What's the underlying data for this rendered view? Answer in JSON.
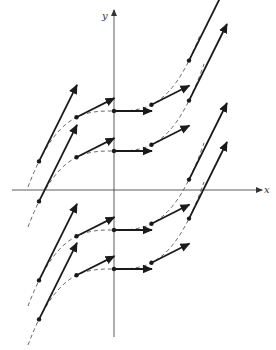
{
  "figure": {
    "type": "slope-field-diagram",
    "axes": {
      "x_label": "x",
      "y_label": "y",
      "origin_px": [
        114,
        190
      ],
      "x_axis_px": {
        "from": 12,
        "to": 262,
        "y": 190
      },
      "y_axis_px": {
        "x": 114,
        "from": 337,
        "to": 10
      }
    },
    "colors": {
      "ink": "#1a1a1a",
      "axis": "#333333",
      "dashed_curve": "#444444",
      "background": "#ffffff"
    },
    "scale": {
      "px_per_unit_x": 37.5
    },
    "rows_y_px": [
      111,
      151,
      230,
      269
    ],
    "segments": [
      {
        "x": 39,
        "y": 111,
        "dx": 38,
        "dy": -98
      },
      {
        "x": 77,
        "y": 118,
        "dx": 37,
        "dy": -18
      },
      {
        "x": 114,
        "y": 111,
        "dx": 38,
        "dy": 0
      },
      {
        "x": 152,
        "y": 104,
        "dx": 37,
        "dy": -18
      },
      {
        "x": 190,
        "y": 98,
        "dx": 38,
        "dy": -75
      },
      {
        "x": 39,
        "y": 190,
        "dx": 38,
        "dy": -98
      },
      {
        "x": 77,
        "y": 157,
        "dx": 37,
        "dy": -18
      },
      {
        "x": 114,
        "y": 151,
        "dx": 38,
        "dy": 0
      },
      {
        "x": 152,
        "y": 144,
        "dx": 37,
        "dy": -18
      },
      {
        "x": 190,
        "y": 218,
        "dx": 38,
        "dy": -113
      },
      {
        "x": 39,
        "y": 281,
        "dx": 38,
        "dy": -98
      },
      {
        "x": 77,
        "y": 236,
        "dx": 37,
        "dy": -18
      },
      {
        "x": 114,
        "y": 230,
        "dx": 38,
        "dy": 0
      },
      {
        "x": 152,
        "y": 224,
        "dx": 37,
        "dy": -18
      },
      {
        "x": 190,
        "y": 217,
        "dx": 38,
        "dy": -75
      },
      {
        "x": 39,
        "y": 321,
        "dx": 38,
        "dy": -98
      },
      {
        "x": 77,
        "y": 276,
        "dx": 37,
        "dy": -18
      },
      {
        "x": 114,
        "y": 269,
        "dx": 38,
        "dy": 0
      },
      {
        "x": 152,
        "y": 263,
        "dx": 37,
        "dy": -18
      },
      {
        "x": 190,
        "y": 190,
        "dx": 0,
        "dy": 0
      }
    ],
    "curves": [
      {
        "C_row_px": 111
      },
      {
        "C_row_px": 151
      },
      {
        "C_row_px": 230
      },
      {
        "C_row_px": 269
      }
    ]
  }
}
